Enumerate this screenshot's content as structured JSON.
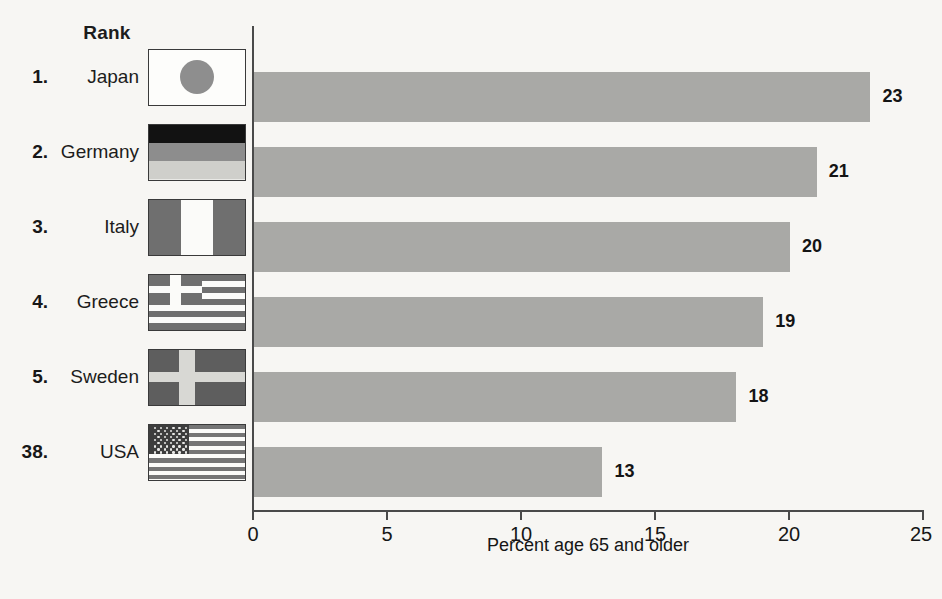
{
  "legend": {
    "rank_header": "Rank"
  },
  "chart_data": {
    "type": "bar",
    "orientation": "horizontal",
    "title": "",
    "xlabel": "Percent age 65 and older",
    "ylabel": "",
    "xlim": [
      0,
      25
    ],
    "xticks": [
      0,
      5,
      10,
      15,
      20,
      25
    ],
    "xtick_labels": [
      "0",
      "5",
      "10",
      "15",
      "20",
      "25"
    ],
    "grid": false,
    "legend_position": "none",
    "bar_color": "#a9a9a6",
    "axis_color": "#4a4a4a",
    "background_color": "#f7f6f3",
    "categories": [
      "Japan",
      "Germany",
      "Italy",
      "Greece",
      "Sweden",
      "USA"
    ],
    "values": [
      23,
      21,
      20,
      19,
      18,
      13
    ],
    "value_labels": [
      "23",
      "21",
      "20",
      "19",
      "18",
      "13"
    ],
    "rows": [
      {
        "rank": "1.",
        "country": "Japan",
        "value": 23,
        "value_label": "23",
        "flag": "japan-flag-icon"
      },
      {
        "rank": "2.",
        "country": "Germany",
        "value": 21,
        "value_label": "21",
        "flag": "germany-flag-icon"
      },
      {
        "rank": "3.",
        "country": "Italy",
        "value": 20,
        "value_label": "20",
        "flag": "italy-flag-icon"
      },
      {
        "rank": "4.",
        "country": "Greece",
        "value": 19,
        "value_label": "19",
        "flag": "greece-flag-icon"
      },
      {
        "rank": "5.",
        "country": "Sweden",
        "value": 18,
        "value_label": "18",
        "flag": "sweden-flag-icon"
      },
      {
        "rank": "38.",
        "country": "USA",
        "value": 13,
        "value_label": "13",
        "flag": "usa-flag-icon"
      }
    ]
  }
}
